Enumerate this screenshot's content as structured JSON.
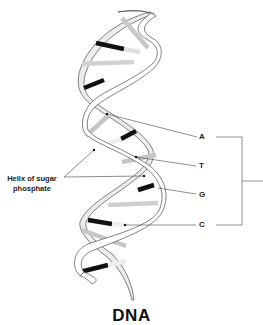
{
  "title": "DNA",
  "labels": {
    "helix": "Helix of sugar phosphate",
    "helix_line1": "Helix of sugar",
    "helix_line2": "phosphate",
    "bases": [
      {
        "letter": "A"
      },
      {
        "letter": "T"
      },
      {
        "letter": "G"
      },
      {
        "letter": "C"
      }
    ]
  },
  "colors": {
    "strand_outline": "#333333",
    "strand_fill": "#ffffff",
    "strand_shade": "#e6e6e6",
    "base_dark": "#111111",
    "base_mid": "#bdbdbd",
    "base_light": "#e2e2e2",
    "leader_line": "#444444"
  }
}
